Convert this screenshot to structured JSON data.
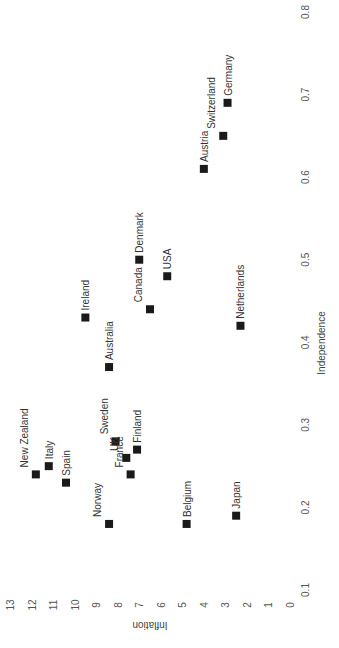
{
  "chart_data": {
    "type": "scatter",
    "title": "",
    "xlabel": "Independence",
    "ylabel": "Inflation",
    "xlim": [
      0.1,
      0.8
    ],
    "ylim": [
      0,
      13
    ],
    "x_ticks": [
      "0.1",
      "0.2",
      "0.3",
      "0.4",
      "0.5",
      "0.6",
      "0.7",
      "0.8"
    ],
    "y_ticks": [
      "0",
      "1",
      "2",
      "3",
      "4",
      "5",
      "6",
      "7",
      "8",
      "9",
      "10",
      "11",
      "12",
      "13"
    ],
    "grid": false,
    "orientation_note": "figure rendered rotated 90 degrees counter-clockwise",
    "points": [
      {
        "label": "New Zealand",
        "x": 0.24,
        "y": 11.8
      },
      {
        "label": "Italy",
        "x": 0.25,
        "y": 11.2
      },
      {
        "label": "Spain",
        "x": 0.23,
        "y": 10.4
      },
      {
        "label": "Sweden",
        "x": 0.28,
        "y": 8.1
      },
      {
        "label": "UK",
        "x": 0.26,
        "y": 7.6
      },
      {
        "label": "Finland",
        "x": 0.27,
        "y": 7.1
      },
      {
        "label": "France",
        "x": 0.24,
        "y": 7.4
      },
      {
        "label": "Norway",
        "x": 0.18,
        "y": 8.4
      },
      {
        "label": "Belgium",
        "x": 0.18,
        "y": 4.8
      },
      {
        "label": "Japan",
        "x": 0.19,
        "y": 2.5
      },
      {
        "label": "Ireland",
        "x": 0.43,
        "y": 9.5
      },
      {
        "label": "Australia",
        "x": 0.37,
        "y": 8.4
      },
      {
        "label": "Canada",
        "x": 0.44,
        "y": 6.5
      },
      {
        "label": "Denmark",
        "x": 0.5,
        "y": 7.0
      },
      {
        "label": "USA",
        "x": 0.48,
        "y": 5.7
      },
      {
        "label": "Netherlands",
        "x": 0.42,
        "y": 2.3
      },
      {
        "label": "Austria",
        "x": 0.61,
        "y": 4.0
      },
      {
        "label": "Switzerland",
        "x": 0.65,
        "y": 3.1
      },
      {
        "label": "Germany",
        "x": 0.69,
        "y": 2.9
      }
    ],
    "label_side": {
      "New Zealand": "left",
      "Italy": "right",
      "Spain": "right",
      "Sweden": "left",
      "UK": "left",
      "Finland": "right",
      "France": "left",
      "Norway": "left",
      "Belgium": "right",
      "Japan": "right",
      "Ireland": "right",
      "Australia": "right",
      "Canada": "left",
      "Denmark": "right",
      "USA": "right",
      "Netherlands": "right",
      "Austria": "right",
      "Switzerland": "left",
      "Germany": "right"
    }
  }
}
